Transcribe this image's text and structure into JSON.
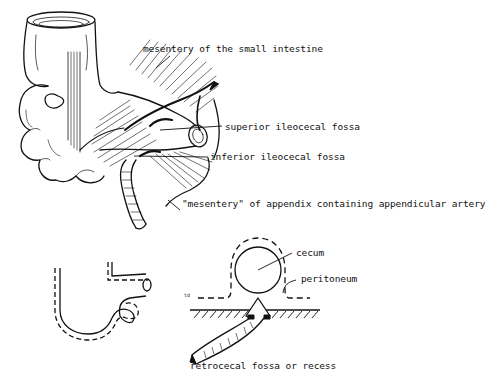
{
  "figure": {
    "top_panel": {
      "labels": [
        {
          "id": "mesentery-small-intestine",
          "text": "mesentery of the small intestine"
        },
        {
          "id": "superior-ileocecal-fossa",
          "text": "superior ileocecal fossa"
        },
        {
          "id": "inferior-ileocecal-fossa",
          "text": "inferior ileocecal fossa"
        },
        {
          "id": "mesentery-of-appendix",
          "text": "\"mesentery\" of appendix containing appendicular artery"
        }
      ]
    },
    "bottom_panel": {
      "labels": [
        {
          "id": "cecum",
          "text": "cecum"
        },
        {
          "id": "peritoneum",
          "text": "peritoneum"
        },
        {
          "id": "retrocecal-fossa",
          "text": "retrocecal fossa or recess"
        },
        {
          "id": "td-mark",
          "text": "td"
        }
      ]
    },
    "colors": {
      "ink": "#111111",
      "background": "#ffffff"
    }
  }
}
